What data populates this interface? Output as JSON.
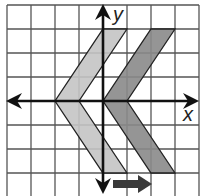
{
  "diagram": {
    "type": "coordinate-grid-translation",
    "axes": {
      "x_label": "x",
      "y_label": "y"
    },
    "grid": {
      "columns_left_of_origin": 4,
      "columns_right_of_origin": 4,
      "rows_above_origin": 4,
      "rows_below_origin": 3,
      "line_color": "#555555",
      "background": "#ffffff"
    },
    "shapes": [
      {
        "name": "pre-image chevron",
        "fill": "#c4c4c4",
        "vertices": [
          [
            0,
            3
          ],
          [
            1,
            3
          ],
          [
            -1,
            0
          ],
          [
            1,
            -3
          ],
          [
            0,
            -3
          ],
          [
            -2,
            0
          ]
        ]
      },
      {
        "name": "image chevron",
        "fill": "#8a8a8a",
        "vertices": [
          [
            2,
            3
          ],
          [
            3,
            3
          ],
          [
            1,
            0
          ],
          [
            3,
            -3
          ],
          [
            2,
            -3
          ],
          [
            0,
            0
          ]
        ]
      }
    ],
    "translation_arrow": {
      "direction": "right",
      "units": 2,
      "color": "#3a3a3a"
    }
  }
}
